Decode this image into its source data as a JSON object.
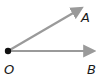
{
  "diagram": {
    "type": "angle",
    "vertex": {
      "label": "O",
      "x": 8,
      "y": 51
    },
    "rays": [
      {
        "name": "OA",
        "label": "A",
        "end": {
          "x": 84,
          "y": 7
        }
      },
      {
        "name": "OB",
        "label": "B",
        "end": {
          "x": 97,
          "y": 51
        }
      }
    ],
    "colors": {
      "ray": "#9a9a9a",
      "vertex": "#111111",
      "label": "#1a1a1a"
    }
  }
}
